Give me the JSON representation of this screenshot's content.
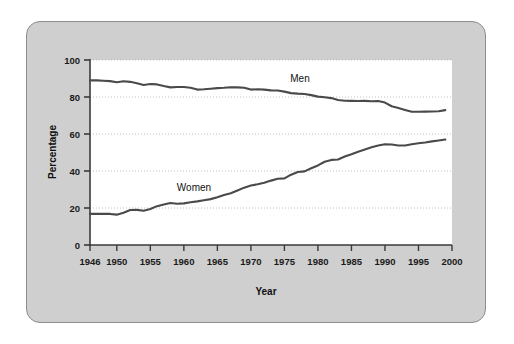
{
  "figure": {
    "panel_bg": "#cfcfcf",
    "panel_border": "#8d8d8d",
    "plot_bg": "#ffffff",
    "axis_color": "#3a3a3a",
    "grid_color": "#b9b9b9",
    "line_color": "#4a4a4a"
  },
  "chart_data": {
    "type": "line",
    "title": "",
    "xlabel": "Year",
    "ylabel": "Percentage",
    "xlim": [
      1946,
      2000
    ],
    "ylim": [
      0,
      100
    ],
    "grid": true,
    "legend_position": "inline-annotation",
    "xticks": [
      1946,
      1950,
      1955,
      1960,
      1965,
      1970,
      1975,
      1980,
      1985,
      1990,
      1995,
      2000
    ],
    "xtick_labels": [
      "1946",
      "1950",
      "1955",
      "1960",
      "1965",
      "1970",
      "1975",
      "1980",
      "1985",
      "1990",
      "1995",
      "2000"
    ],
    "yticks": [
      0,
      20,
      40,
      60,
      80,
      100
    ],
    "ytick_labels": [
      "0",
      "20",
      "40",
      "60",
      "80",
      "100"
    ],
    "x": [
      1946,
      1947,
      1948,
      1949,
      1950,
      1951,
      1952,
      1953,
      1954,
      1955,
      1956,
      1957,
      1958,
      1959,
      1960,
      1961,
      1962,
      1963,
      1964,
      1965,
      1966,
      1967,
      1968,
      1969,
      1970,
      1971,
      1972,
      1973,
      1974,
      1975,
      1976,
      1977,
      1978,
      1979,
      1980,
      1981,
      1982,
      1983,
      1984,
      1985,
      1986,
      1987,
      1988,
      1989,
      1990,
      1991,
      1992,
      1993,
      1994,
      1995,
      1996,
      1997,
      1998,
      1999
    ],
    "series": [
      {
        "name": "Men",
        "label": "Men",
        "annotation": "Men",
        "color": "#4a4a4a",
        "values": [
          89.0,
          89.0,
          88.8,
          88.6,
          88.0,
          88.5,
          88.2,
          87.4,
          86.5,
          87.0,
          86.8,
          85.9,
          85.2,
          85.4,
          85.4,
          85.0,
          84.0,
          84.2,
          84.5,
          84.8,
          85.0,
          85.3,
          85.2,
          85.0,
          84.0,
          84.2,
          84.0,
          83.6,
          83.5,
          82.9,
          82.1,
          81.8,
          81.6,
          81.0,
          80.2,
          79.9,
          79.4,
          78.4,
          78.0,
          77.9,
          77.8,
          77.9,
          77.7,
          77.8,
          77.0,
          75.0,
          74.0,
          73.0,
          72.0,
          72.0,
          72.1,
          72.2,
          72.3,
          72.9
        ]
      },
      {
        "name": "Women",
        "label": "Women",
        "annotation": "Women",
        "color": "#4a4a4a",
        "values": [
          16.8,
          16.8,
          16.8,
          16.8,
          16.4,
          17.4,
          18.9,
          19.0,
          18.5,
          19.5,
          21.0,
          21.9,
          22.7,
          22.3,
          22.5,
          23.1,
          23.6,
          24.2,
          24.8,
          25.8,
          27.0,
          28.0,
          29.5,
          31.0,
          32.2,
          32.8,
          33.6,
          34.8,
          35.8,
          36.0,
          38.0,
          39.5,
          39.8,
          41.5,
          43.0,
          45.0,
          46.0,
          46.2,
          47.8,
          49.0,
          50.4,
          51.6,
          52.8,
          53.8,
          54.5,
          54.3,
          53.8,
          53.8,
          54.5,
          55.0,
          55.4,
          56.0,
          56.5,
          57.0
        ]
      }
    ]
  },
  "labels": {
    "y_axis_title": "Percentage",
    "x_axis_title": "Year",
    "men_annotation": "Men",
    "women_annotation": "Women"
  }
}
